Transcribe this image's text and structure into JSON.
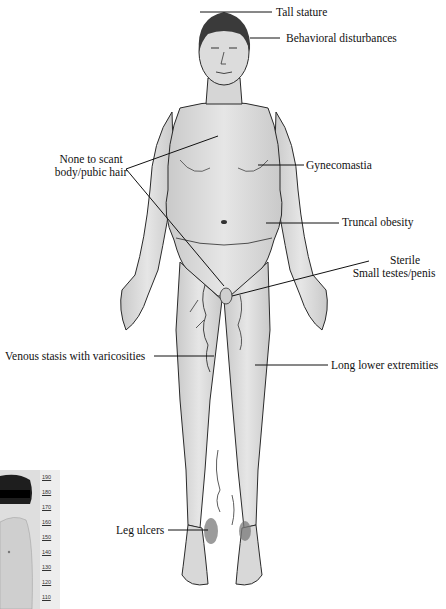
{
  "figure": {
    "labels": {
      "tall_stature": "Tall stature",
      "behavioral": "Behavioral disturbances",
      "hair_line1": "None to scant",
      "hair_line2": "body/pubic hair",
      "gynecomastia": "Gynecomastia",
      "truncal_obesity": "Truncal obesity",
      "sterile": "Sterile",
      "small_testes": "Small testes/penis",
      "venous_stasis": "Venous stasis with varicosities",
      "long_lower": "Long lower extremities",
      "leg_ulcers": "Leg ulcers"
    },
    "inset_photo": {
      "ruler_ticks": [
        "190",
        "180",
        "170",
        "160",
        "150",
        "140",
        "130",
        "120",
        "110"
      ]
    },
    "colors": {
      "background": "#ffffff",
      "skin": "#dcdcdc",
      "outline": "#2a2a2a",
      "hair": "#3a3a3a",
      "text": "#111111"
    }
  }
}
